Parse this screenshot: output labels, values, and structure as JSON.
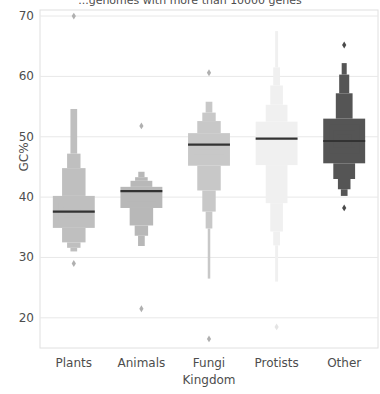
{
  "chart_data": {
    "type": "box",
    "title": "...genomes with more than 10000 genes",
    "xlabel": "Kingdom",
    "ylabel": "GC%",
    "grid": true,
    "legend": false,
    "ylim": [
      15,
      71
    ],
    "yticks": [
      70,
      60,
      50,
      40,
      30,
      20
    ],
    "categories": [
      "Plants",
      "Animals",
      "Fungi",
      "Protists",
      "Other"
    ],
    "medians": [
      37.6,
      41.0,
      48.7,
      49.7,
      49.3
    ],
    "colors": {
      "plants": "#bfbfbf",
      "animals": "#b8b8b8",
      "fungi": "#c8c8c8",
      "protists": "#f0f0f0",
      "other": "#555555",
      "median_line": "#333333",
      "grid": "#e8e8e8",
      "frame": "#e0e0e0",
      "text": "#4d4d4d"
    },
    "series": [
      {
        "name": "Plants",
        "median": 37.6,
        "boxes": [
          {
            "low": 34.9,
            "high": 40.2,
            "width": 1.0
          },
          {
            "low": 36.0,
            "high": 39.0,
            "width": 0.72
          },
          {
            "low": 36.6,
            "high": 38.3,
            "width": 0.5
          },
          {
            "low": 37.0,
            "high": 37.9,
            "width": 0.34
          },
          {
            "low": 37.2,
            "high": 37.7,
            "width": 0.22
          }
        ],
        "upper_steps": [
          {
            "low": 40.2,
            "high": 44.8,
            "width": 0.56
          },
          {
            "low": 44.8,
            "high": 47.2,
            "width": 0.32
          },
          {
            "low": 47.2,
            "high": 54.6,
            "width": 0.16
          }
        ],
        "lower_steps": [
          {
            "low": 32.5,
            "high": 34.9,
            "width": 0.56
          },
          {
            "low": 31.6,
            "high": 32.5,
            "width": 0.32
          },
          {
            "low": 31.0,
            "high": 31.6,
            "width": 0.16
          }
        ],
        "outliers": [
          70.0,
          29.0
        ]
      },
      {
        "name": "Animals",
        "median": 41.0,
        "boxes": [
          {
            "low": 38.2,
            "high": 41.7,
            "width": 1.0
          },
          {
            "low": 39.3,
            "high": 41.5,
            "width": 0.72
          },
          {
            "low": 40.1,
            "high": 41.3,
            "width": 0.5
          },
          {
            "low": 40.5,
            "high": 41.2,
            "width": 0.34
          },
          {
            "low": 40.7,
            "high": 41.1,
            "width": 0.22
          }
        ],
        "upper_steps": [
          {
            "low": 41.7,
            "high": 42.7,
            "width": 0.52
          },
          {
            "low": 42.7,
            "high": 43.3,
            "width": 0.3
          },
          {
            "low": 43.3,
            "high": 44.2,
            "width": 0.15
          }
        ],
        "lower_steps": [
          {
            "low": 35.3,
            "high": 38.2,
            "width": 0.56
          },
          {
            "low": 33.6,
            "high": 35.3,
            "width": 0.32
          },
          {
            "low": 31.9,
            "high": 33.6,
            "width": 0.16
          }
        ],
        "outliers": [
          51.8,
          21.5
        ]
      },
      {
        "name": "Fungi",
        "median": 48.7,
        "boxes": [
          {
            "low": 45.2,
            "high": 50.6,
            "width": 1.0
          },
          {
            "low": 47.0,
            "high": 49.8,
            "width": 0.72
          },
          {
            "low": 47.9,
            "high": 49.3,
            "width": 0.5
          },
          {
            "low": 48.3,
            "high": 49.0,
            "width": 0.34
          },
          {
            "low": 48.5,
            "high": 48.9,
            "width": 0.22
          }
        ],
        "upper_steps": [
          {
            "low": 50.6,
            "high": 52.6,
            "width": 0.56
          },
          {
            "low": 52.6,
            "high": 54.0,
            "width": 0.32
          },
          {
            "low": 54.0,
            "high": 55.8,
            "width": 0.16
          }
        ],
        "lower_steps": [
          {
            "low": 41.1,
            "high": 45.2,
            "width": 0.56
          },
          {
            "low": 37.6,
            "high": 41.1,
            "width": 0.32
          },
          {
            "low": 34.8,
            "high": 37.6,
            "width": 0.16
          },
          {
            "low": 26.5,
            "high": 34.8,
            "width": 0.06
          }
        ],
        "outliers": [
          60.6,
          16.5
        ]
      },
      {
        "name": "Protists",
        "median": 49.7,
        "boxes": [
          {
            "low": 45.3,
            "high": 52.5,
            "width": 1.0
          },
          {
            "low": 47.0,
            "high": 51.3,
            "width": 0.72
          },
          {
            "low": 48.2,
            "high": 50.6,
            "width": 0.5
          },
          {
            "low": 48.9,
            "high": 50.2,
            "width": 0.34
          },
          {
            "low": 49.3,
            "high": 50.0,
            "width": 0.22
          }
        ],
        "upper_steps": [
          {
            "low": 52.5,
            "high": 55.3,
            "width": 0.52
          },
          {
            "low": 55.3,
            "high": 58.5,
            "width": 0.3
          },
          {
            "low": 58.5,
            "high": 61.5,
            "width": 0.16
          },
          {
            "low": 61.5,
            "high": 67.5,
            "width": 0.07
          }
        ],
        "lower_steps": [
          {
            "low": 39.0,
            "high": 45.3,
            "width": 0.52
          },
          {
            "low": 34.3,
            "high": 39.0,
            "width": 0.3
          },
          {
            "low": 32.0,
            "high": 34.3,
            "width": 0.16
          },
          {
            "low": 26.0,
            "high": 32.0,
            "width": 0.07
          }
        ],
        "outliers": [
          18.5
        ]
      },
      {
        "name": "Other",
        "median": 49.3,
        "boxes": [
          {
            "low": 45.6,
            "high": 53.0,
            "width": 1.0
          },
          {
            "low": 47.2,
            "high": 52.0,
            "width": 0.72
          },
          {
            "low": 48.2,
            "high": 51.0,
            "width": 0.5
          },
          {
            "low": 48.7,
            "high": 50.3,
            "width": 0.34
          },
          {
            "low": 49.0,
            "high": 49.9,
            "width": 0.22
          }
        ],
        "upper_steps": [
          {
            "low": 53.0,
            "high": 57.2,
            "width": 0.4
          },
          {
            "low": 57.2,
            "high": 60.3,
            "width": 0.24
          },
          {
            "low": 60.3,
            "high": 62.2,
            "width": 0.12
          }
        ],
        "lower_steps": [
          {
            "low": 43.0,
            "high": 45.6,
            "width": 0.52
          },
          {
            "low": 41.3,
            "high": 43.0,
            "width": 0.3
          },
          {
            "low": 40.2,
            "high": 41.3,
            "width": 0.16
          }
        ],
        "outliers": [
          65.2,
          38.2
        ]
      }
    ]
  }
}
